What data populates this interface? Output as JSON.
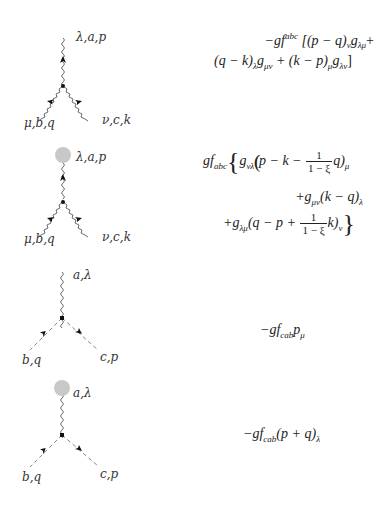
{
  "vertices": [
    {
      "id": "three-gluon-vertex",
      "type": "gluon-gluon-gluon",
      "has_background_blob": false,
      "labels": {
        "top": "λ,a,p",
        "bottom_left": "μ,b,q",
        "bottom_right": "ν,c,k"
      },
      "rule_lines": [
        "−gf^abc [(p − q)_ν g_λμ +",
        "(q − k)_λ g_μν + (k − p)_μ g_λν]"
      ],
      "rule": {
        "line1": {
          "prefix": "−g",
          "f": "f",
          "f_sup": "abc",
          "rest": "[(p − q)",
          "s1": "ν",
          "g1": "g",
          "g1_sub": "λμ",
          "end": "+"
        },
        "line2": {
          "a": "(q − k)",
          "a_sub": "λ",
          "g2": "g",
          "g2_sub": "μν",
          "b": " + (k − p)",
          "b_sub": "μ",
          "g3": "g",
          "g3_sub": "λν",
          "end": "]"
        }
      }
    },
    {
      "id": "three-gluon-vertex-background",
      "type": "background-gluon-gluon-gluon",
      "has_background_blob": true,
      "labels": {
        "top": "λ,a,p",
        "bottom_left": "μ,b,q",
        "bottom_right": "ν,c,k"
      },
      "rule_lines": [
        "gf_abc { g_νλ (p − k − 1/(1−ξ) q)_μ",
        "+g_μν (k − q)_λ",
        "+g_λμ (q − p + 1/(1−ξ) k)_ν }"
      ],
      "rule": {
        "pre": "gf",
        "pre_sub": "abc",
        "open": "{",
        "l1": {
          "g": "g",
          "g_sub": "νλ",
          "a": "(p − k − ",
          "num": "1",
          "den": "1 − ξ",
          "b": "q)",
          "sub": "μ"
        },
        "l2": {
          "a": "+g",
          "a_sub": "μν",
          "b": "(k − q)",
          "sub": "λ"
        },
        "l3": {
          "a": "+g",
          "a_sub": "λμ",
          "b": "(q − p + ",
          "num": "1",
          "den": "1 − ξ",
          "c": "k)",
          "sub": "ν"
        },
        "close": "}"
      }
    },
    {
      "id": "ghost-gluon-vertex",
      "type": "ghost-ghost-gluon",
      "has_background_blob": false,
      "labels": {
        "top": "a,λ",
        "bottom_left": "b,q",
        "bottom_right": "c,p"
      },
      "rule_lines": [
        "−gf_cab p_μ"
      ],
      "rule": {
        "a": "−gf",
        "a_sub": "cab",
        "b": "p",
        "b_sub": "μ"
      }
    },
    {
      "id": "ghost-gluon-vertex-background",
      "type": "background-ghost-ghost-gluon",
      "has_background_blob": true,
      "labels": {
        "top": "a,λ",
        "bottom_left": "b,q",
        "bottom_right": "c,p"
      },
      "rule_lines": [
        "−gf_cab (p + q)_λ"
      ],
      "rule": {
        "a": "−gf",
        "a_sub": "cab",
        "b": "(p + q)",
        "b_sub": "λ"
      }
    }
  ],
  "colors": {
    "line": "#555555",
    "vertex_dot": "#111111",
    "arrow": "#111111",
    "blob": "#c8c8c8",
    "dashed": "#888888"
  }
}
